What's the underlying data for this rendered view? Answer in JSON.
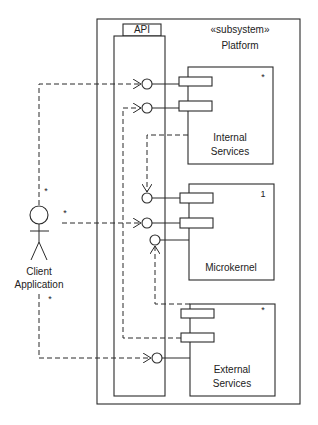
{
  "diagram": {
    "type": "UML component diagram",
    "subsystem": {
      "stereotype": "«subsystem»",
      "name": "Platform"
    },
    "api": {
      "label": "API"
    },
    "components": [
      {
        "id": "internal",
        "line1": "Internal",
        "line2": "Services",
        "multiplicity": "*"
      },
      {
        "id": "microkernel",
        "line1": "Microkernel",
        "line2": "",
        "multiplicity": "1"
      },
      {
        "id": "external",
        "line1": "External",
        "line2": "Services",
        "multiplicity": "*"
      }
    ],
    "actor": {
      "line1": "Client",
      "line2": "Application",
      "multiplicities": [
        "*",
        "*",
        "*"
      ]
    },
    "colors": {
      "stroke": "#2a2a2a",
      "background": "#ffffff"
    }
  }
}
